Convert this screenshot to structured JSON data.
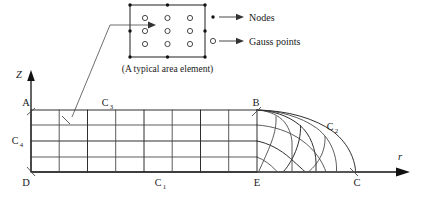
{
  "figure": {
    "background_color": "#ffffff",
    "line_color": "#4a4a4a",
    "text_color": "#1a1a1a"
  },
  "detail_callout": {
    "caption": "(A typical area element)",
    "element": {
      "node_marker": "filled-dot",
      "gauss_marker": "open-circle",
      "node_count": 8,
      "gauss_count": 9,
      "gauss_grid": "3x3"
    }
  },
  "legend": {
    "items": [
      {
        "marker": "filled-dot",
        "label": "Nodes"
      },
      {
        "marker": "open-circle",
        "label": "Gauss points"
      }
    ]
  },
  "axes": {
    "vertical": {
      "label": "Z",
      "direction": "up"
    },
    "horizontal": {
      "label": "r",
      "direction": "right"
    }
  },
  "mesh": {
    "corner_labels": {
      "top_left": "A",
      "top_right": "B",
      "bottom_left": "D",
      "bottom_mid": "E",
      "bottom_right": "C"
    },
    "boundary_labels": {
      "bottom": "C1",
      "curved": "C2",
      "top": "C3",
      "left": "C4"
    },
    "boundary_labels_display": {
      "bottom": {
        "base": "C",
        "sub": "1"
      },
      "curved": {
        "base": "C",
        "sub": "2"
      },
      "top": {
        "base": "C",
        "sub": "3"
      },
      "left": {
        "base": "C",
        "sub": "4"
      }
    },
    "rectangular_region": {
      "columns": 8,
      "rows": 4
    },
    "curved_region": {
      "radial_divisions": 4,
      "angular_divisions": 4
    }
  }
}
